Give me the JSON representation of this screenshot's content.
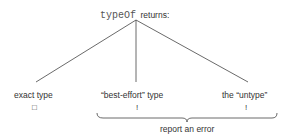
{
  "title": {
    "code": "typeOf",
    "text": "returns:"
  },
  "branches": [
    {
      "label": "exact type",
      "marker": "□",
      "marker_name": "empty-box"
    },
    {
      "label": "“best-effort” type",
      "marker": "!",
      "marker_name": "exclamation"
    },
    {
      "label": "the “untype”",
      "marker": "!",
      "marker_name": "exclamation"
    }
  ],
  "brace_label": "report an error"
}
